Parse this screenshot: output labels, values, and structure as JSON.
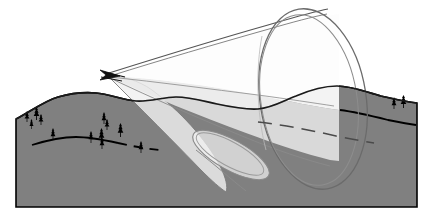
{
  "figure": {
    "width": 425,
    "height": 221,
    "background_color": "#ffffff"
  },
  "colors": {
    "terrain_fill": "#808080",
    "terrain_outline": "#000000",
    "cone_stroke": "#666666",
    "cone_fill_light": "#f2f2f2",
    "cone_fill_lower": "#e8e8e8",
    "tree_color": "#000000",
    "contour_line": "#000000",
    "background": "#ffffff"
  },
  "scene": {
    "terrain": {
      "name": "terrain-block",
      "ridge_path": "M16,119 C30,112 44,101 58,97 C72,93 84,92 96,93 C110,94 122,100 136,101 C150,102 163,97 176,97 C190,97 203,101 217,104 C231,107 245,110 258,109 C272,108 283,101 296,96 C310,90 323,86 337,86 C352,86 366,92 381,96 C394,99 406,102 417,103 L417,207 L16,207 Z",
      "top_left_y": 119,
      "bottom_y": 207,
      "left_x": 16,
      "right_x": 417
    },
    "contour_line": {
      "name": "terrain-contour-line",
      "solid_path": "M32,145 C48,140 62,137 76,137 C90,137 104,140 118,143",
      "dashed_path": "M118,143 C132,146 146,149 160,150",
      "dash_pattern": "9 7",
      "right_solid_path": "M340,110 C356,112 372,116 388,120 C398,122 408,124 416,125",
      "inner_dashed_path": "M258,122 C284,125 310,130 336,136 C350,139 362,141 374,143",
      "inner_dash_pattern": "14 8"
    },
    "trees": [
      {
        "x": 24,
        "y": 111,
        "h": 11,
        "w": 6
      },
      {
        "x": 33,
        "y": 107,
        "h": 13,
        "w": 7
      },
      {
        "x": 38,
        "y": 114,
        "h": 11,
        "w": 6
      },
      {
        "x": 29,
        "y": 119,
        "h": 10,
        "w": 5
      },
      {
        "x": 50,
        "y": 128,
        "h": 12,
        "w": 6
      },
      {
        "x": 88,
        "y": 131,
        "h": 12,
        "w": 6
      },
      {
        "x": 98,
        "y": 128,
        "h": 14,
        "w": 7
      },
      {
        "x": 99,
        "y": 137,
        "h": 12,
        "w": 6
      },
      {
        "x": 101,
        "y": 112,
        "h": 12,
        "w": 6
      },
      {
        "x": 104,
        "y": 119,
        "h": 11,
        "w": 6
      },
      {
        "x": 117,
        "y": 123,
        "h": 14,
        "w": 7
      },
      {
        "x": 138,
        "y": 141,
        "h": 12,
        "w": 6
      },
      {
        "x": 391,
        "y": 97,
        "h": 12,
        "w": 6
      },
      {
        "x": 400,
        "y": 95,
        "h": 13,
        "w": 7
      }
    ],
    "cone": {
      "name": "radar-beam-cone",
      "apex": {
        "x": 108,
        "y": 74
      },
      "mouth_ellipse": {
        "cx": 312,
        "cy": 98,
        "rx": 54,
        "ry": 92,
        "rotation": -10
      },
      "inner_ellipse": {
        "cx": 309,
        "cy": 99,
        "rx": 50,
        "ry": 88,
        "rotation": -10
      },
      "lower_lobe": {
        "cx": 231,
        "cy": 156,
        "rx": 44,
        "ry": 16,
        "rotation": 28
      }
    },
    "apex_marker": {
      "name": "beam-origin-arrow",
      "description": "dart/arrow glyph at cone apex",
      "x": 108,
      "y": 74
    }
  }
}
